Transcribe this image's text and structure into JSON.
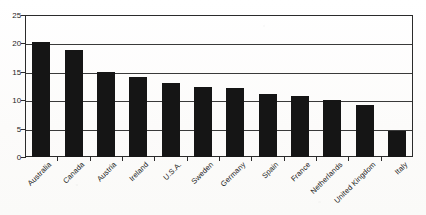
{
  "chart_data": {
    "type": "bar",
    "title": "",
    "subtitle": "",
    "xlabel": "",
    "ylabel": "",
    "categories": [
      "Australia",
      "Canada",
      "Austria",
      "Ireland",
      "U.S.A.",
      "Sweden",
      "Germany",
      "Spain",
      "France",
      "Netherlands",
      "United Kingdom",
      "Italy"
    ],
    "values": [
      20.2,
      18.9,
      15.0,
      14.1,
      13.0,
      12.4,
      12.2,
      11.1,
      10.7,
      10.1,
      9.2,
      4.5
    ],
    "ylim": [
      0,
      25
    ],
    "yticks": [
      0,
      5,
      10,
      15,
      20,
      25
    ],
    "ytick_labels": [
      "0",
      "5",
      "10",
      "15",
      "20",
      "25"
    ],
    "grid": true,
    "grid_axis": "y",
    "legend": false,
    "legend_position": "none",
    "bar_color": "#151515",
    "axis_color": "#2b2b2b",
    "gridline_color": "#3a3a3a",
    "background_color": "#fdfdfc",
    "xtick_label_rotation": -45,
    "series": [
      {
        "name": "",
        "values": [
          20.2,
          18.9,
          15.0,
          14.1,
          13.0,
          12.4,
          12.2,
          11.1,
          10.7,
          10.1,
          9.2,
          4.5
        ]
      }
    ]
  }
}
